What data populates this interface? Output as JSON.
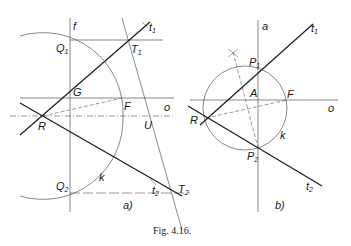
{
  "figure": {
    "caption": "Fig. 4.16.",
    "panels": [
      {
        "id": "a",
        "tag": "a)",
        "labels": {
          "f": "f",
          "t1": "t",
          "t1_sub": "1",
          "Q1": "Q",
          "Q1_sub": "1",
          "T1": "T",
          "T1_sub": "1",
          "G": "G",
          "F": "F",
          "o": "o",
          "R": "R",
          "U": "U",
          "k": "k",
          "Q2": "Q",
          "Q2_sub": "2",
          "t2": "t",
          "t2_sub": "2",
          "T2": "T",
          "T2_sub": "2"
        }
      },
      {
        "id": "b",
        "tag": "b)",
        "labels": {
          "a": "a",
          "t1": "t",
          "t1_sub": "1",
          "P1": "P",
          "P1_sub": "1",
          "A": "A",
          "F": "F",
          "o": "o",
          "R": "R",
          "k": "k",
          "P2": "P",
          "P2_sub": "2",
          "t2": "t",
          "t2_sub": "2"
        }
      }
    ]
  },
  "colors": {
    "ink": "#1a1a1a",
    "thin": "#555555",
    "background": "#ffffff"
  }
}
